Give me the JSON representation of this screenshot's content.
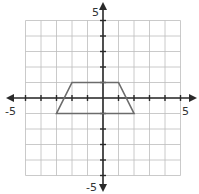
{
  "chart_data": {
    "type": "coordinate-grid",
    "title": "",
    "xlim": [
      -5,
      5
    ],
    "ylim": [
      -5,
      5
    ],
    "grid": true,
    "tick_labels": {
      "x_min": "-5",
      "x_max": "5",
      "y_min": "-5",
      "y_max": "5"
    },
    "shapes": [
      {
        "name": "trapezoid",
        "vertices": [
          [
            -2,
            1
          ],
          [
            1,
            1
          ],
          [
            2,
            -1
          ],
          [
            -3,
            -1
          ]
        ],
        "stroke": "#6b6b6b"
      }
    ]
  },
  "labels": {
    "x_min": "-5",
    "x_max": "5",
    "y_min": "-5",
    "y_max": "5"
  },
  "colors": {
    "grid": "#bdbdbd",
    "axis": "#2a2a2a",
    "shape": "#6b6b6b"
  }
}
